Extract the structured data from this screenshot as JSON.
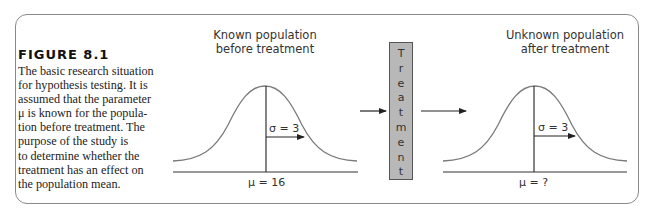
{
  "figure": {
    "label": "FIGURE 8.1",
    "caption_lines": [
      "The basic research situation",
      "for hypothesis testing. It is",
      "assumed that the parameter",
      "μ is known for the popula-",
      "tion before treatment. The",
      "purpose of the study is",
      "to determine whether the",
      "treatment has an effect on",
      "the population mean."
    ]
  },
  "left_panel": {
    "title_line1": "Known population",
    "title_line2": "before treatment",
    "sigma_label": "σ = 3",
    "mu_label": "μ = 16"
  },
  "treatment": {
    "letters": [
      "T",
      "r",
      "e",
      "a",
      "t",
      "m",
      "e",
      "n",
      "t"
    ]
  },
  "right_panel": {
    "title_line1": "Unknown population",
    "title_line2": "after treatment",
    "sigma_label": "σ = 3",
    "mu_label": "μ = ?"
  },
  "colors": {
    "frame": "#8a8a8a",
    "curve": "#7a7a7a",
    "treatment_box": "#b8b8b8",
    "line": "#333333"
  }
}
